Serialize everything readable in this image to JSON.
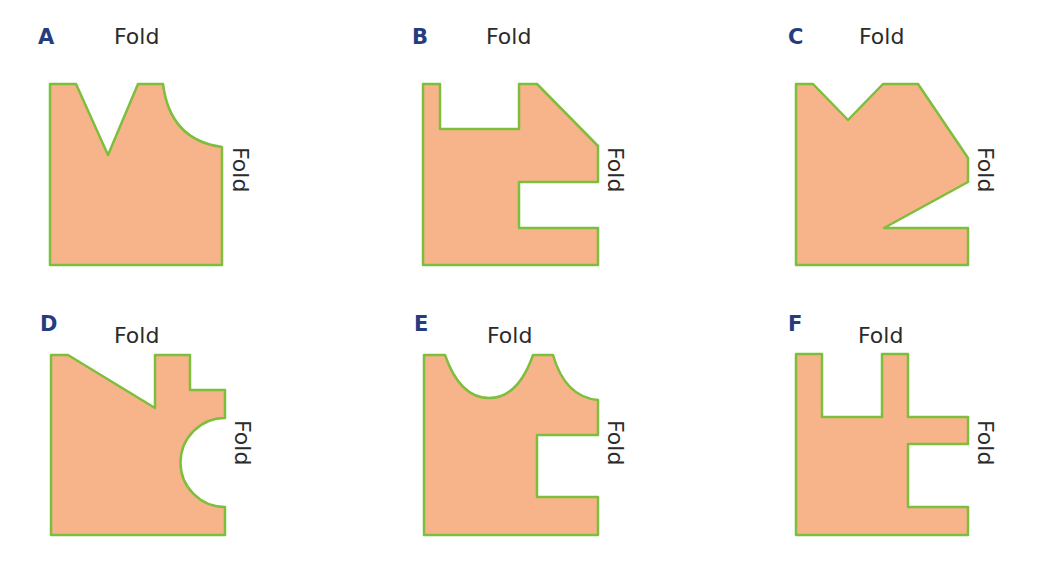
{
  "colors": {
    "shape_fill": "#F7B48A",
    "shape_stroke": "#7DBE3C",
    "letter": "#253C7E",
    "fold_text": "#2b2b2b"
  },
  "fold_label": "Fold",
  "panels": [
    {
      "letter": "A",
      "top_label": "Fold",
      "side_label": "Fold"
    },
    {
      "letter": "B",
      "top_label": "Fold",
      "side_label": "Fold"
    },
    {
      "letter": "C",
      "top_label": "Fold",
      "side_label": "Fold"
    },
    {
      "letter": "D",
      "top_label": "Fold",
      "side_label": "Fold"
    },
    {
      "letter": "E",
      "top_label": "Fold",
      "side_label": "Fold"
    },
    {
      "letter": "F",
      "top_label": "Fold",
      "side_label": "Fold"
    }
  ]
}
